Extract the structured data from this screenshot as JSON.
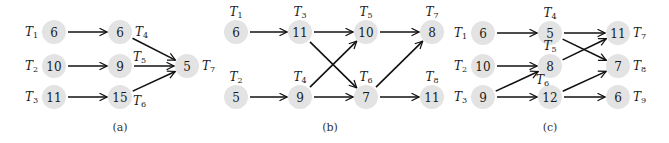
{
  "colors": {
    "node_fill": "#e3e3e3",
    "edge": "#111111",
    "text": "#1a1a1a",
    "background": "#ffffff"
  },
  "node_radius": 12,
  "panels": [
    {
      "id": "a",
      "caption": "(a)",
      "caption_pos": [
        120,
        127
      ],
      "nodes": [
        {
          "id": "T1",
          "task": "T",
          "sub": "1",
          "value": "6",
          "x": 54,
          "y": 32,
          "label_pos": "left"
        },
        {
          "id": "T2",
          "task": "T",
          "sub": "2",
          "value": "10",
          "x": 54,
          "y": 66,
          "label_pos": "left"
        },
        {
          "id": "T3",
          "task": "T",
          "sub": "3",
          "value": "11",
          "x": 54,
          "y": 97,
          "label_pos": "left"
        },
        {
          "id": "T4",
          "task": "T",
          "sub": "4",
          "value": "6",
          "x": 120,
          "y": 32,
          "label_pos": "right"
        },
        {
          "id": "T5",
          "task": "T",
          "sub": "5",
          "value": "9",
          "x": 120,
          "y": 66,
          "label_pos": "upper-right"
        },
        {
          "id": "T6",
          "task": "T",
          "sub": "6",
          "value": "15",
          "x": 120,
          "y": 97,
          "label_pos": "lower-right"
        },
        {
          "id": "T7",
          "task": "T",
          "sub": "7",
          "value": "5",
          "x": 187,
          "y": 66,
          "label_pos": "right"
        }
      ],
      "edges": [
        [
          "T1",
          "T4"
        ],
        [
          "T2",
          "T5"
        ],
        [
          "T3",
          "T6"
        ],
        [
          "T4",
          "T7"
        ],
        [
          "T5",
          "T7"
        ],
        [
          "T6",
          "T7"
        ]
      ]
    },
    {
      "id": "b",
      "caption": "(b)",
      "caption_pos": [
        330,
        127
      ],
      "nodes": [
        {
          "id": "T1",
          "task": "T",
          "sub": "1",
          "value": "6",
          "x": 236,
          "y": 32,
          "label_pos": "above"
        },
        {
          "id": "T2",
          "task": "T",
          "sub": "2",
          "value": "5",
          "x": 236,
          "y": 97,
          "label_pos": "above"
        },
        {
          "id": "T3",
          "task": "T",
          "sub": "3",
          "value": "11",
          "x": 300,
          "y": 32,
          "label_pos": "above"
        },
        {
          "id": "T4",
          "task": "T",
          "sub": "4",
          "value": "9",
          "x": 300,
          "y": 97,
          "label_pos": "above"
        },
        {
          "id": "T5",
          "task": "T",
          "sub": "5",
          "value": "10",
          "x": 366,
          "y": 32,
          "label_pos": "above"
        },
        {
          "id": "T6",
          "task": "T",
          "sub": "6",
          "value": "7",
          "x": 366,
          "y": 97,
          "label_pos": "above"
        },
        {
          "id": "T7",
          "task": "T",
          "sub": "7",
          "value": "8",
          "x": 432,
          "y": 32,
          "label_pos": "above"
        },
        {
          "id": "T8",
          "task": "T",
          "sub": "8",
          "value": "11",
          "x": 432,
          "y": 97,
          "label_pos": "above"
        }
      ],
      "edges": [
        [
          "T1",
          "T3"
        ],
        [
          "T2",
          "T4"
        ],
        [
          "T3",
          "T5"
        ],
        [
          "T3",
          "T6"
        ],
        [
          "T4",
          "T5"
        ],
        [
          "T4",
          "T6"
        ],
        [
          "T5",
          "T7"
        ],
        [
          "T6",
          "T7"
        ],
        [
          "T6",
          "T8"
        ]
      ]
    },
    {
      "id": "c",
      "caption": "(c)",
      "caption_pos": [
        550,
        127
      ],
      "nodes": [
        {
          "id": "T1",
          "task": "T",
          "sub": "1",
          "value": "6",
          "x": 483,
          "y": 33,
          "label_pos": "left"
        },
        {
          "id": "T2",
          "task": "T",
          "sub": "2",
          "value": "10",
          "x": 483,
          "y": 66,
          "label_pos": "left"
        },
        {
          "id": "T3",
          "task": "T",
          "sub": "3",
          "value": "9",
          "x": 483,
          "y": 97,
          "label_pos": "left"
        },
        {
          "id": "T4",
          "task": "T",
          "sub": "4",
          "value": "5",
          "x": 550,
          "y": 33,
          "label_pos": "above"
        },
        {
          "id": "T5",
          "task": "T",
          "sub": "5",
          "value": "8",
          "x": 550,
          "y": 66,
          "label_pos": "above"
        },
        {
          "id": "T6",
          "task": "T",
          "sub": "6",
          "value": "12",
          "x": 550,
          "y": 97,
          "label_pos": "upper-left"
        },
        {
          "id": "T7",
          "task": "T",
          "sub": "7",
          "value": "11",
          "x": 618,
          "y": 33,
          "label_pos": "right"
        },
        {
          "id": "T8",
          "task": "T",
          "sub": "8",
          "value": "7",
          "x": 618,
          "y": 66,
          "label_pos": "right"
        },
        {
          "id": "T9",
          "task": "T",
          "sub": "9",
          "value": "6",
          "x": 618,
          "y": 97,
          "label_pos": "right"
        }
      ],
      "edges": [
        [
          "T1",
          "T4"
        ],
        [
          "T2",
          "T5"
        ],
        [
          "T3",
          "T5"
        ],
        [
          "T3",
          "T6"
        ],
        [
          "T4",
          "T7"
        ],
        [
          "T4",
          "T8"
        ],
        [
          "T5",
          "T7"
        ],
        [
          "T6",
          "T8"
        ],
        [
          "T6",
          "T9"
        ]
      ]
    }
  ]
}
